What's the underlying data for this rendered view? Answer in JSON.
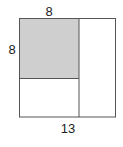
{
  "diagram": {
    "labels": {
      "top": "8",
      "left": "8",
      "bottom": "13"
    },
    "colors": {
      "shade": "#cfcfcf",
      "stroke": "#555555",
      "background": "#ffffff"
    }
  }
}
